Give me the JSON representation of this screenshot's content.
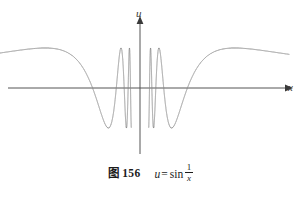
{
  "figure": {
    "caption_number": "图 156",
    "formula": {
      "lhs": "u",
      "equals": "=",
      "function": "sin",
      "fraction_numerator": "1",
      "fraction_denominator": "x"
    }
  },
  "axes": {
    "y_label": "u",
    "x_label": "x",
    "axis_color": "#555555"
  },
  "chart_data": {
    "type": "line",
    "title": "",
    "subtitle": "",
    "xlabel": "x",
    "ylabel": "u",
    "function": "u = sin(1/x)",
    "grid": false,
    "legend": null,
    "xlim": [
      -1.0,
      1.0
    ],
    "ylim": [
      -1.15,
      1.15
    ],
    "axis_origin_px": {
      "x": 140,
      "y": 88
    },
    "curve_color": "#8a8a8a",
    "curve_width_px": 0.9,
    "x_domain_drawn_px": [
      12,
      289
    ],
    "peak_top_px": 48,
    "trough_bottom_px": 126,
    "sample_points": [
      {
        "x": -1.0,
        "u": -0.841
      },
      {
        "x": -0.9,
        "u": -0.878
      },
      {
        "x": -0.8,
        "u": -0.949
      },
      {
        "x": -0.7,
        "u": -0.99
      },
      {
        "x": -0.6,
        "u": -0.995
      },
      {
        "x": -0.5,
        "u": -0.909
      },
      {
        "x": -0.45,
        "u": -0.825
      },
      {
        "x": -0.4,
        "u": -0.598
      },
      {
        "x": -0.35,
        "u": -0.22
      },
      {
        "x": -0.32,
        "u": 0.1
      },
      {
        "x": -0.3,
        "u": 0.191
      },
      {
        "x": -0.28,
        "u": 0.52
      },
      {
        "x": -0.25,
        "u": 0.745
      },
      {
        "x": -0.22,
        "u": 0.995
      },
      {
        "x": -0.2,
        "u": 0.959
      },
      {
        "x": -0.18,
        "u": 0.73
      },
      {
        "x": -0.16,
        "u": 0.2
      },
      {
        "x": -0.15,
        "u": -0.19
      },
      {
        "x": -0.13,
        "u": -0.97
      },
      {
        "x": -0.12,
        "u": -0.76
      },
      {
        "x": -0.11,
        "u": 0.1
      },
      {
        "x": -0.1,
        "u": 0.544
      },
      {
        "x": -0.09,
        "u": 0.96
      },
      {
        "x": -0.08,
        "u": 0.07
      },
      {
        "x": -0.07,
        "u": -0.9
      },
      {
        "x": -0.06,
        "u": 0.66
      },
      {
        "x": -0.05,
        "u": 0.913
      },
      {
        "x": -0.04,
        "u": -0.132
      },
      {
        "x": -0.03,
        "u": -0.99
      },
      {
        "x": -0.02,
        "u": 0.99
      },
      {
        "x": -0.01,
        "u": -0.506
      },
      {
        "x": 0.0,
        "u": null
      },
      {
        "x": 0.01,
        "u": 0.506
      },
      {
        "x": 0.02,
        "u": -0.99
      },
      {
        "x": 0.03,
        "u": 0.99
      },
      {
        "x": 0.04,
        "u": 0.132
      },
      {
        "x": 0.05,
        "u": -0.913
      },
      {
        "x": 0.06,
        "u": -0.66
      },
      {
        "x": 0.07,
        "u": 0.9
      },
      {
        "x": 0.08,
        "u": -0.07
      },
      {
        "x": 0.09,
        "u": -0.96
      },
      {
        "x": 0.1,
        "u": -0.544
      },
      {
        "x": 0.11,
        "u": -0.1
      },
      {
        "x": 0.12,
        "u": 0.76
      },
      {
        "x": 0.13,
        "u": 0.97
      },
      {
        "x": 0.15,
        "u": 0.19
      },
      {
        "x": 0.16,
        "u": -0.2
      },
      {
        "x": 0.18,
        "u": -0.73
      },
      {
        "x": 0.2,
        "u": -0.959
      },
      {
        "x": 0.22,
        "u": -0.995
      },
      {
        "x": 0.25,
        "u": -0.745
      },
      {
        "x": 0.28,
        "u": -0.52
      },
      {
        "x": 0.3,
        "u": -0.191
      },
      {
        "x": 0.32,
        "u": -0.1
      },
      {
        "x": 0.35,
        "u": 0.22
      },
      {
        "x": 0.4,
        "u": 0.598
      },
      {
        "x": 0.45,
        "u": 0.825
      },
      {
        "x": 0.5,
        "u": 0.909
      },
      {
        "x": 0.6,
        "u": 0.995
      },
      {
        "x": 0.7,
        "u": 0.99
      },
      {
        "x": 0.8,
        "u": 0.949
      },
      {
        "x": 0.9,
        "u": 0.878
      },
      {
        "x": 1.0,
        "u": 0.841
      }
    ]
  }
}
